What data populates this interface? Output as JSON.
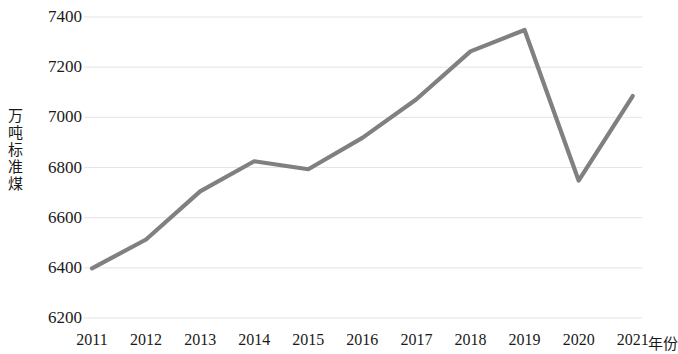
{
  "chart_data": {
    "type": "line",
    "title": "",
    "xlabel": "年份",
    "ylabel": "万吨标准煤",
    "categories": [
      "2011",
      "2012",
      "2013",
      "2014",
      "2015",
      "2016",
      "2017",
      "2018",
      "2019",
      "2020",
      "2021"
    ],
    "values": [
      6398,
      6513,
      6705,
      6825,
      6793,
      6918,
      7072,
      7263,
      7348,
      6748,
      7085
    ],
    "series": [
      {
        "name": "",
        "values": [
          6398,
          6513,
          6705,
          6825,
          6793,
          6918,
          7072,
          7263,
          7348,
          6748,
          7085
        ]
      }
    ],
    "ylim": [
      6200,
      7400
    ],
    "yticks": [
      6200,
      6400,
      6600,
      6800,
      7000,
      7200,
      7400
    ],
    "ytick_labels": [
      "6200",
      "6400",
      "6600",
      "6800",
      "7000",
      "7200",
      "7400"
    ],
    "grid": true,
    "grid_axis": "y",
    "legend": false,
    "legend_position": "none",
    "line_color": "#808080",
    "grid_color": "#e3e3e8",
    "background_color": "#ffffff",
    "text_color": "#1a1a1a"
  }
}
